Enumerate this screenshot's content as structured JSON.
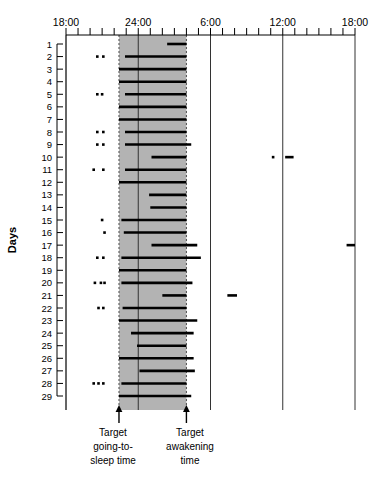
{
  "chart_data": {
    "type": "bar",
    "title": "",
    "xlabel": "",
    "ylabel": "Days",
    "x_tick_labels": [
      "18:00",
      "24:00",
      "6:00",
      "12:00",
      "18:00"
    ],
    "x_tick_hours": [
      18,
      24,
      30,
      36,
      42
    ],
    "xlim_hours": [
      18,
      42
    ],
    "minor_tick_interval_hours": 1,
    "grid": "vertical-lines-at-major-ticks",
    "legend": "none",
    "y_categories": [
      1,
      2,
      3,
      4,
      5,
      6,
      7,
      8,
      9,
      10,
      11,
      12,
      13,
      14,
      15,
      16,
      17,
      18,
      19,
      20,
      21,
      22,
      23,
      24,
      25,
      26,
      27,
      28,
      29
    ],
    "ylim": [
      1,
      29
    ],
    "target_band": {
      "label_start": "Target going-to-sleep time",
      "label_end": "Target awakening time",
      "start_hour": 22.4,
      "end_hour": 28.0,
      "fill_color": "#b3b3b3",
      "edge_style": "dashed"
    },
    "bar_color": "#000000",
    "series_name": "Sleep episodes",
    "sleep_episodes": [
      {
        "day": 1,
        "segments": [
          [
            26.4,
            28.0
          ]
        ],
        "marks": []
      },
      {
        "day": 2,
        "segments": [
          [
            22.9,
            28.0
          ]
        ],
        "marks": [
          20.6,
          21.1
        ]
      },
      {
        "day": 3,
        "segments": [
          [
            22.4,
            28.0
          ]
        ],
        "marks": []
      },
      {
        "day": 4,
        "segments": [
          [
            22.4,
            28.0
          ]
        ],
        "marks": []
      },
      {
        "day": 5,
        "segments": [
          [
            22.9,
            28.0
          ]
        ],
        "marks": [
          20.6,
          21.0
        ]
      },
      {
        "day": 6,
        "segments": [
          [
            22.4,
            28.0
          ]
        ],
        "marks": []
      },
      {
        "day": 7,
        "segments": [
          [
            22.4,
            28.0
          ]
        ],
        "marks": []
      },
      {
        "day": 8,
        "segments": [
          [
            22.9,
            28.0
          ]
        ],
        "marks": [
          20.6,
          21.1
        ]
      },
      {
        "day": 9,
        "segments": [
          [
            22.9,
            28.4
          ]
        ],
        "marks": [
          20.6,
          21.1
        ]
      },
      {
        "day": 10,
        "segments": [
          [
            25.1,
            28.0
          ],
          [
            36.2,
            36.9
          ]
        ],
        "marks": [
          35.2
        ]
      },
      {
        "day": 11,
        "segments": [
          [
            22.9,
            28.0
          ]
        ],
        "marks": [
          20.3,
          21.1
        ]
      },
      {
        "day": 12,
        "segments": [
          [
            22.4,
            28.0
          ]
        ],
        "marks": []
      },
      {
        "day": 13,
        "segments": [
          [
            24.9,
            28.0
          ]
        ],
        "marks": []
      },
      {
        "day": 14,
        "segments": [
          [
            25.0,
            28.0
          ]
        ],
        "marks": []
      },
      {
        "day": 15,
        "segments": [
          [
            22.6,
            28.0
          ]
        ],
        "marks": [
          21.0
        ]
      },
      {
        "day": 16,
        "segments": [
          [
            22.8,
            28.0
          ]
        ],
        "marks": [
          21.2
        ]
      },
      {
        "day": 17,
        "segments": [
          [
            25.1,
            28.9
          ],
          [
            41.3,
            42.0
          ]
        ],
        "marks": []
      },
      {
        "day": 18,
        "segments": [
          [
            22.6,
            29.2
          ]
        ],
        "marks": [
          20.6,
          21.1
        ]
      },
      {
        "day": 19,
        "segments": [
          [
            22.4,
            28.0
          ]
        ],
        "marks": []
      },
      {
        "day": 20,
        "segments": [
          [
            22.6,
            28.5
          ]
        ],
        "marks": [
          20.4,
          20.9,
          21.2
        ]
      },
      {
        "day": 21,
        "segments": [
          [
            26.0,
            28.0
          ],
          [
            31.4,
            32.2
          ]
        ],
        "marks": []
      },
      {
        "day": 22,
        "segments": [
          [
            22.7,
            28.0
          ]
        ],
        "marks": [
          20.7,
          21.1
        ]
      },
      {
        "day": 23,
        "segments": [
          [
            22.4,
            28.9
          ]
        ],
        "marks": []
      },
      {
        "day": 24,
        "segments": [
          [
            23.4,
            28.6
          ]
        ],
        "marks": []
      },
      {
        "day": 25,
        "segments": [
          [
            23.9,
            28.0
          ]
        ],
        "marks": []
      },
      {
        "day": 26,
        "segments": [
          [
            22.4,
            28.6
          ]
        ],
        "marks": []
      },
      {
        "day": 27,
        "segments": [
          [
            24.1,
            28.7
          ]
        ],
        "marks": []
      },
      {
        "day": 28,
        "segments": [
          [
            22.6,
            28.0
          ]
        ],
        "marks": [
          20.3,
          20.7,
          21.1
        ]
      },
      {
        "day": 29,
        "segments": [
          [
            22.4,
            28.4
          ]
        ],
        "marks": []
      }
    ]
  },
  "annotations": {
    "sleep_time_line1": "Target",
    "sleep_time_line2": "going-to-",
    "sleep_time_line3": "sleep time",
    "wake_time_line1": "Target",
    "wake_time_line2": "awakening",
    "wake_time_line3": "time"
  }
}
